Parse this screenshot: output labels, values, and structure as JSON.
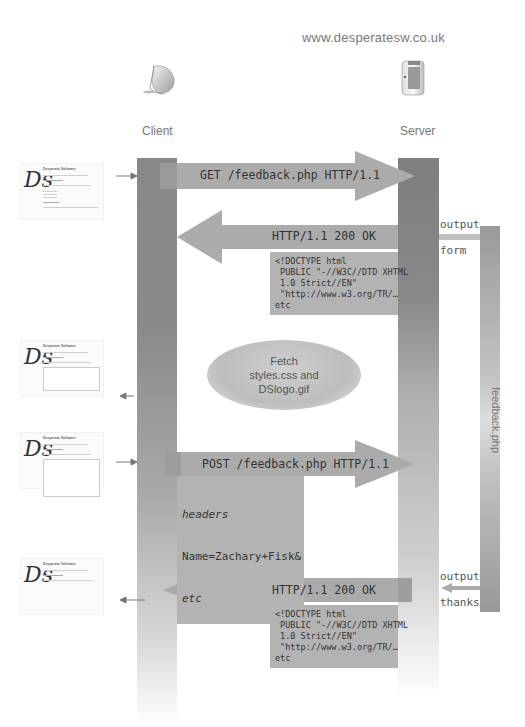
{
  "site_url": "www.desperatesw.co.uk",
  "actors": {
    "client": {
      "label": "Client",
      "icon": "imac-icon"
    },
    "server": {
      "label": "Server",
      "icon": "server-icon"
    }
  },
  "script": {
    "label": "feedback.php"
  },
  "messages": [
    {
      "id": "get-request",
      "direction": "client-to-server",
      "label": "GET /feedback.php HTTP/1.1"
    },
    {
      "id": "form-response",
      "direction": "server-to-client",
      "label": "HTTP/1.1 200 OK",
      "body": "<!DOCTYPE html\n PUBLIC \"-//W3C//DTD XHTML\n 1.0 Strict//EN\"\n \"http://www.w3.org/TR/…\netc"
    },
    {
      "id": "post-request",
      "direction": "client-to-server",
      "label": "POST /feedback.php HTTP/1.1",
      "body_italic_1": "headers",
      "body_line": "Name=Zachary+Fisk&",
      "body_italic_2": "etc"
    },
    {
      "id": "thanks-response",
      "direction": "server-to-client",
      "label": "HTTP/1.1 200 OK",
      "body": "<!DOCTYPE html\n PUBLIC \"-//W3C//DTD XHTML\n 1.0 Strict//EN\"\n \"http://www.w3.org/TR/…\netc"
    }
  ],
  "script_outputs": [
    {
      "line1": "output",
      "line2": "form"
    },
    {
      "line1": "output",
      "line2": "thanks"
    }
  ],
  "fetch_note": "Fetch\nstyles.css and\nDSlogo.gif",
  "thumbnails": [
    {
      "title": "Desperate Software",
      "state": "link page"
    },
    {
      "title": "Desperate Software",
      "state": "feedback form"
    },
    {
      "title": "Desperate Software",
      "state": "filled form"
    },
    {
      "title": "Desperate Software",
      "state": "thanks page"
    }
  ]
}
